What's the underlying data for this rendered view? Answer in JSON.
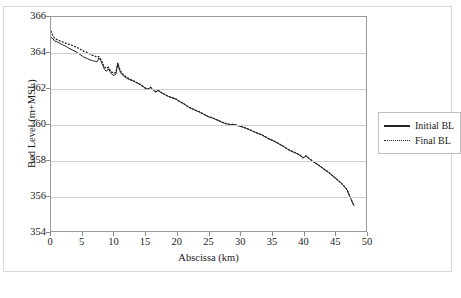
{
  "chart_data": {
    "type": "line",
    "title": "",
    "xlabel": "Abscissa (km)",
    "ylabel": "Bed Level (m+MSL)",
    "xlim": [
      0,
      50
    ],
    "ylim": [
      354,
      366
    ],
    "xticks": [
      0,
      5,
      10,
      15,
      20,
      25,
      30,
      35,
      40,
      45,
      50
    ],
    "yticks": [
      354,
      356,
      358,
      360,
      362,
      364,
      366
    ],
    "grid": "horizontal",
    "legend_position": "right",
    "series": [
      {
        "name": "Initial BL",
        "style": "solid",
        "color": "#222222",
        "x": [
          0.0,
          0.3,
          0.6,
          1.0,
          1.4,
          1.8,
          2.2,
          2.6,
          3.0,
          3.4,
          3.8,
          4.2,
          4.6,
          5.0,
          5.4,
          5.8,
          6.2,
          6.6,
          7.0,
          7.3,
          7.6,
          7.9,
          8.2,
          8.5,
          8.8,
          9.1,
          9.4,
          9.7,
          10.0,
          10.3,
          10.6,
          10.9,
          11.2,
          11.5,
          11.8,
          12.1,
          12.4,
          12.7,
          13.0,
          13.4,
          13.8,
          14.2,
          14.6,
          15.0,
          15.4,
          15.8,
          16.2,
          16.6,
          17.0,
          17.4,
          17.8,
          18.2,
          18.6,
          19.0,
          19.4,
          19.8,
          20.2,
          20.6,
          21.0,
          21.4,
          21.8,
          22.2,
          22.6,
          23.0,
          23.4,
          23.8,
          24.2,
          24.6,
          25.0,
          25.5,
          26.0,
          26.5,
          27.0,
          27.5,
          28.0,
          28.5,
          29.0,
          29.5,
          30.0,
          30.5,
          31.0,
          31.5,
          32.0,
          32.5,
          33.0,
          33.5,
          34.0,
          34.5,
          35.0,
          35.5,
          36.0,
          36.5,
          37.0,
          37.5,
          38.0,
          38.5,
          39.0,
          39.5,
          40.0,
          40.5,
          41.0,
          41.5,
          42.0,
          42.5,
          43.0,
          43.5,
          44.0,
          44.5,
          45.0,
          45.5,
          46.0,
          46.5,
          47.0,
          47.3,
          47.6,
          47.9,
          48.1
        ],
        "y": [
          364.85,
          364.78,
          364.65,
          364.6,
          364.52,
          364.45,
          364.38,
          364.3,
          364.22,
          364.15,
          364.08,
          364.0,
          363.9,
          363.8,
          363.72,
          363.66,
          363.6,
          363.55,
          363.52,
          363.48,
          363.7,
          363.55,
          363.3,
          363.05,
          362.95,
          363.1,
          362.92,
          362.78,
          362.72,
          362.8,
          363.4,
          363.0,
          362.8,
          362.7,
          362.62,
          362.55,
          362.5,
          362.45,
          362.42,
          362.35,
          362.28,
          362.2,
          362.1,
          362.0,
          361.95,
          362.05,
          361.92,
          361.8,
          361.88,
          361.78,
          361.7,
          361.62,
          361.55,
          361.5,
          361.45,
          361.4,
          361.3,
          361.22,
          361.15,
          361.05,
          360.95,
          360.88,
          360.82,
          360.75,
          360.7,
          360.62,
          360.55,
          360.48,
          360.4,
          360.35,
          360.28,
          360.2,
          360.12,
          360.05,
          360.0,
          359.96,
          359.98,
          359.92,
          359.88,
          359.82,
          359.75,
          359.68,
          359.6,
          359.52,
          359.45,
          359.38,
          359.28,
          359.18,
          359.1,
          359.02,
          358.92,
          358.82,
          358.72,
          358.6,
          358.5,
          358.42,
          358.35,
          358.25,
          358.1,
          358.2,
          358.05,
          357.92,
          357.8,
          357.68,
          357.55,
          357.42,
          357.3,
          357.15,
          357.0,
          356.85,
          356.7,
          356.52,
          356.3,
          356.05,
          355.8,
          355.55,
          355.42
        ]
      },
      {
        "name": "Final BL",
        "style": "dotted",
        "color": "#222222",
        "x": [
          0.0,
          0.3,
          0.6,
          1.0,
          1.4,
          1.8,
          2.2,
          2.6,
          3.0,
          3.4,
          3.8,
          4.2,
          4.6,
          5.0,
          5.4,
          5.8,
          6.2,
          6.6,
          7.0,
          7.3,
          7.6,
          7.9,
          8.2,
          8.5,
          8.8,
          9.1,
          9.4,
          9.7,
          10.0,
          10.3,
          10.6,
          10.9,
          11.2,
          11.5,
          11.8,
          12.1,
          12.4,
          12.7,
          13.0,
          13.4,
          13.8,
          14.2,
          14.6,
          15.0,
          15.4,
          15.8,
          16.2,
          16.6,
          17.0,
          17.4,
          17.8,
          18.2,
          18.6,
          19.0,
          19.4,
          19.8,
          20.2,
          20.6,
          21.0,
          21.4,
          21.8,
          22.2,
          22.6,
          23.0,
          23.4,
          23.8,
          24.2,
          24.6,
          25.0,
          25.5,
          26.0,
          26.5,
          27.0,
          27.5,
          28.0,
          28.5,
          29.0,
          29.5,
          30.0,
          30.5,
          31.0,
          31.5,
          32.0,
          32.5,
          33.0,
          33.5,
          34.0,
          34.5,
          35.0,
          35.5,
          36.0,
          36.5,
          37.0,
          37.5,
          38.0,
          38.5,
          39.0,
          39.5,
          40.0,
          40.5,
          41.0,
          41.5,
          42.0,
          42.5,
          43.0,
          43.5,
          44.0,
          44.5,
          45.0,
          45.5,
          46.0,
          46.5,
          47.0,
          47.3,
          47.6,
          47.9,
          48.1
        ],
        "y": [
          365.2,
          364.95,
          364.8,
          364.72,
          364.66,
          364.6,
          364.55,
          364.5,
          364.45,
          364.4,
          364.34,
          364.28,
          364.2,
          364.12,
          364.05,
          364.0,
          363.92,
          363.85,
          363.8,
          363.74,
          363.78,
          363.62,
          363.4,
          363.2,
          363.12,
          363.18,
          363.02,
          362.9,
          362.85,
          362.9,
          363.42,
          363.08,
          362.88,
          362.76,
          362.68,
          362.6,
          362.54,
          362.48,
          362.44,
          362.36,
          362.29,
          362.21,
          362.11,
          362.01,
          361.96,
          362.06,
          361.93,
          361.81,
          361.89,
          361.79,
          361.71,
          361.63,
          361.56,
          361.51,
          361.46,
          361.41,
          361.31,
          361.23,
          361.16,
          361.06,
          360.96,
          360.89,
          360.83,
          360.76,
          360.71,
          360.63,
          360.56,
          360.49,
          360.41,
          360.36,
          360.29,
          360.21,
          360.13,
          360.06,
          360.01,
          359.97,
          359.99,
          359.93,
          359.89,
          359.83,
          359.76,
          359.69,
          359.61,
          359.53,
          359.46,
          359.39,
          359.29,
          359.19,
          359.11,
          359.03,
          358.93,
          358.83,
          358.73,
          358.61,
          358.51,
          358.43,
          358.36,
          358.26,
          358.11,
          358.21,
          358.06,
          357.93,
          357.81,
          357.69,
          357.56,
          357.43,
          357.31,
          357.16,
          357.01,
          356.86,
          356.71,
          356.53,
          356.31,
          356.06,
          355.81,
          355.56,
          355.43
        ]
      }
    ]
  }
}
